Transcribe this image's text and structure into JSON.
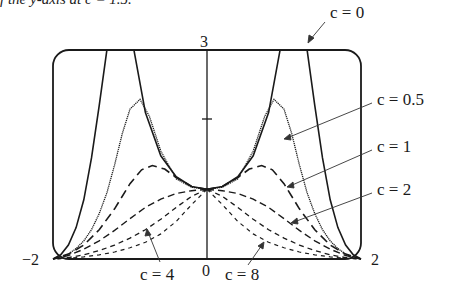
{
  "header": {
    "cropped_text": "f the y-axis at c = 1.5."
  },
  "chart_data": {
    "type": "line",
    "title": "",
    "xlabel": "",
    "ylabel": "",
    "xlim": [
      -2,
      2
    ],
    "ylim": [
      0,
      3
    ],
    "grid": false,
    "tick_labels": {
      "x": [
        "−2",
        "0",
        "2"
      ],
      "y": [
        "3"
      ]
    },
    "y_ticks_marks": [
      2
    ],
    "legend": "annotations with arrows",
    "annotations": [
      "c = 0",
      "c = 0.5",
      "c = 1",
      "c = 2",
      "c = 4",
      "c = 8"
    ],
    "series": [
      {
        "name": "c = 0",
        "style": "solid",
        "x": [
          0,
          0.2,
          0.4,
          0.6,
          0.8,
          0.95,
          1.3,
          1.4,
          1.5,
          1.6,
          1.7,
          1.8,
          1.9,
          2.0
        ],
        "y": [
          1,
          1.04,
          1.18,
          1.48,
          2.1,
          3.0,
          3.0,
          2.2,
          1.45,
          0.85,
          0.45,
          0.2,
          0.06,
          0
        ]
      },
      {
        "name": "c = 0.5",
        "style": "dotted-solid",
        "x": [
          0,
          0.2,
          0.4,
          0.6,
          0.75,
          0.87,
          1.0,
          1.1,
          1.2,
          1.3,
          1.4,
          1.5,
          1.6,
          1.7,
          1.8,
          1.9,
          2.0
        ],
        "y": [
          1,
          1.03,
          1.15,
          1.55,
          2.05,
          2.29,
          2.15,
          1.8,
          1.35,
          0.95,
          0.65,
          0.42,
          0.26,
          0.15,
          0.07,
          0.02,
          0
        ]
      },
      {
        "name": "c = 1",
        "style": "long-dash",
        "x": [
          0,
          0.2,
          0.4,
          0.55,
          0.71,
          0.85,
          1.0,
          1.2,
          1.4,
          1.6,
          1.8,
          2.0
        ],
        "y": [
          1,
          1.04,
          1.17,
          1.29,
          1.34,
          1.28,
          1.08,
          0.72,
          0.42,
          0.2,
          0.07,
          0
        ]
      },
      {
        "name": "c = 2",
        "style": "dash",
        "x": [
          0,
          0.2,
          0.4,
          0.6,
          0.8,
          1.0,
          1.2,
          1.4,
          1.6,
          1.8,
          2.0
        ],
        "y": [
          1,
          0.98,
          0.94,
          0.86,
          0.74,
          0.58,
          0.41,
          0.26,
          0.14,
          0.05,
          0
        ]
      },
      {
        "name": "c = 4",
        "style": "short-dash",
        "x": [
          0,
          0.2,
          0.4,
          0.6,
          0.8,
          1.0,
          1.2,
          1.4,
          1.6,
          1.8,
          2.0
        ],
        "y": [
          1,
          0.9,
          0.74,
          0.57,
          0.42,
          0.3,
          0.2,
          0.12,
          0.06,
          0.02,
          0
        ]
      },
      {
        "name": "c = 8",
        "style": "fine-dash",
        "x": [
          0,
          0.2,
          0.4,
          0.6,
          0.8,
          1.0,
          1.2,
          1.4,
          1.6,
          1.8,
          2.0
        ],
        "y": [
          1,
          0.78,
          0.54,
          0.36,
          0.24,
          0.16,
          0.1,
          0.06,
          0.03,
          0.01,
          0
        ]
      }
    ],
    "symmetric_about_y_axis": true,
    "note": "all curves pass through (0,1) and vanish at x = ±2; curves symmetric"
  },
  "labels": {
    "c0": "c = 0",
    "c05": "c = 0.5",
    "c1": "c = 1",
    "c2": "c = 2",
    "c4": "c = 4",
    "c8": "c = 8",
    "xneg": "−2",
    "xzero": "0",
    "xpos": "2",
    "ytop": "3"
  }
}
